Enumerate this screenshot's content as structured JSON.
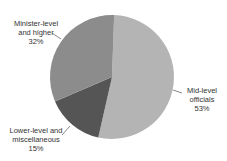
{
  "chart_data": {
    "type": "pie",
    "title": "",
    "categories": [
      "Mid-level officials",
      "Lower-level and miscellaneous",
      "Minister-level and higher"
    ],
    "values": [
      53,
      15,
      32
    ],
    "unit": "%",
    "colors": [
      "#b4b4b4",
      "#555555",
      "#8c8c8c"
    ],
    "start_angle_deg": 2,
    "direction": "clockwise",
    "legend": "none (direct labels with leader lines)"
  },
  "labels": {
    "minister": {
      "line1": "Minister-level",
      "line2": "and higher",
      "pct": "32%"
    },
    "mid": {
      "line1": "Mid-level",
      "line2": "officials",
      "pct": "53%"
    },
    "lower": {
      "line1": "Lower-level and",
      "line2": "miscellaneous",
      "pct": "15%"
    }
  }
}
